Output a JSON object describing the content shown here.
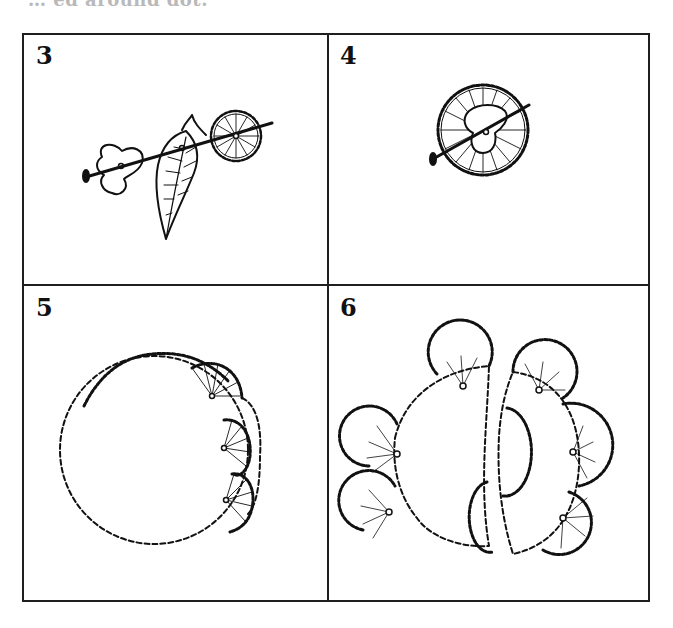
{
  "header": {
    "partial_text": "… ed around dot."
  },
  "panels": [
    {
      "step": "3",
      "description": "Flower, leaf and pompom threaded onto a pin"
    },
    {
      "step": "4",
      "description": "Pompom pinned through flower center"
    },
    {
      "step": "5",
      "description": "Large round pompom with smaller pompoms attached around edge"
    },
    {
      "step": "6",
      "description": "Two halves with pompoms arranged around edges"
    }
  ],
  "colors": {
    "ink": "#111111",
    "background": "#ffffff",
    "faded_text": "#b9b9b9"
  }
}
